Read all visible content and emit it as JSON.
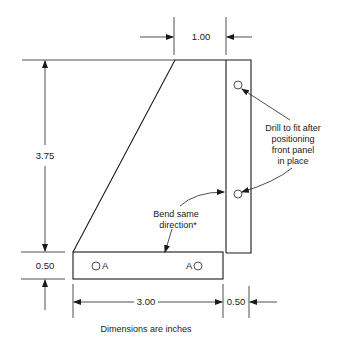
{
  "dimensions": {
    "top_width": "1.00",
    "height": "3.75",
    "strip_height": "0.50",
    "strip_length": "3.00",
    "flange_width": "0.50"
  },
  "notes": {
    "drill_line1": "Drill to fit after",
    "drill_line2": "positioning",
    "drill_line3": "front panel",
    "drill_line4": "in place",
    "bend_line1": "Bend same",
    "bend_line2": "direction*",
    "caption": "Dimensions are inches"
  },
  "hole_labels": {
    "left": "A",
    "right": "A"
  }
}
